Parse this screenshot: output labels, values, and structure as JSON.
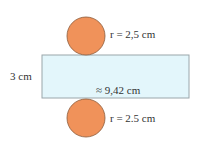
{
  "diagram": {
    "top_circle": {
      "label": "r = 2,5 cm",
      "fill": "#f0925a",
      "stroke": "#8a5a3a"
    },
    "bottom_circle": {
      "label": "r = 2.5 cm",
      "fill": "#f0925a",
      "stroke": "#8a5a3a"
    },
    "rectangle": {
      "height_label": "3 cm",
      "width_label": "≈ 9,42 cm",
      "fill": "#e3f6fb",
      "stroke": "#9aa6aa"
    }
  }
}
